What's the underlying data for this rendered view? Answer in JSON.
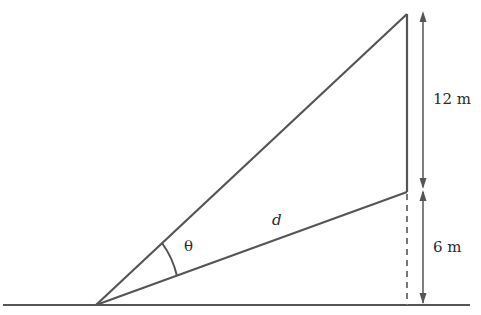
{
  "diagram": {
    "type": "geometry",
    "labels": {
      "upper_height": "12 m",
      "lower_height": "6 m",
      "distance": "d",
      "angle": "θ"
    },
    "colors": {
      "line": "#555555",
      "text": "#2a2a2a",
      "background": "#ffffff"
    }
  }
}
